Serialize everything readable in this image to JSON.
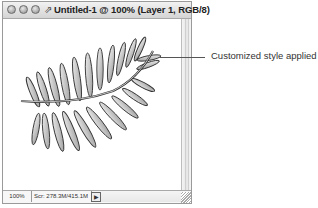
{
  "window": {
    "title": "Untitled-1 @ 100% (Layer 1, RGB/8)",
    "doc_icon": "document-icon",
    "buttons": [
      "close",
      "minimize",
      "zoom"
    ]
  },
  "canvas": {
    "image": "fern-leaf-illustration",
    "fill_color": "#ffffff"
  },
  "statusbar": {
    "zoom": "100%",
    "scratch": "Scr: 278.3M/415.1M",
    "menu_arrow": "▶"
  },
  "callout": {
    "text": "Customized style applied"
  }
}
